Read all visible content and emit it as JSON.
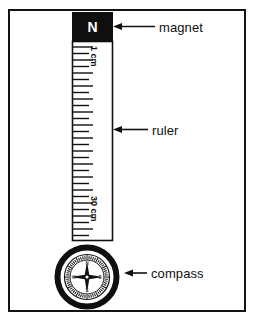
{
  "figure": {
    "background_color": "#ffffff",
    "border_color": "#131313",
    "ink_color": "#111111"
  },
  "apparatus": {
    "magnet": {
      "label": "magnet",
      "pole_letter": "N",
      "fill_color": "#0f0f0f",
      "letter_color": "#ffffff"
    },
    "ruler": {
      "label": "ruler",
      "top_mark": "1 cm",
      "bottom_mark": "30 cm",
      "tick_count": 30,
      "fill_color": "#ffffff",
      "outline_color": "#111111"
    },
    "compass": {
      "label": "compass",
      "cardinals": [
        "N",
        "E",
        "S",
        "W"
      ],
      "ring_color": "#0f0f0f",
      "face_color": "#ffffff",
      "needle_color": "#111111"
    }
  },
  "callouts": [
    {
      "name": "magnet-callout",
      "text": "magnet"
    },
    {
      "name": "ruler-callout",
      "text": "ruler"
    },
    {
      "name": "compass-callout",
      "text": "compass"
    }
  ]
}
